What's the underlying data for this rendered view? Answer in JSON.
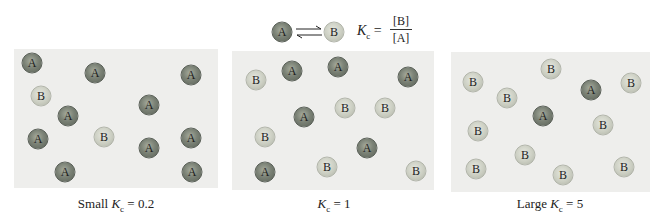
{
  "header": {
    "reactant_label": "A",
    "product_label": "B",
    "equilibrium_symbol": "⇌",
    "kc_symbol": "K",
    "kc_subscript": "c",
    "equals": "=",
    "numerator": "[B]",
    "denominator": "[A]"
  },
  "colors": {
    "panel_bg": "#eeeeec",
    "sphere_A": "#6e7569",
    "sphere_B": "#cbcec2"
  },
  "panels": [
    {
      "caption_prefix": "Small ",
      "caption_k": "K",
      "caption_sub": "c",
      "caption_suffix": " = 0.2",
      "count_A": 10,
      "count_B": 2,
      "molecules": [
        {
          "type": "A",
          "x": 32,
          "y": 63
        },
        {
          "type": "A",
          "x": 95,
          "y": 73
        },
        {
          "type": "A",
          "x": 191,
          "y": 75
        },
        {
          "type": "B",
          "x": 41,
          "y": 96
        },
        {
          "type": "A",
          "x": 68,
          "y": 116
        },
        {
          "type": "A",
          "x": 149,
          "y": 105
        },
        {
          "type": "A",
          "x": 38,
          "y": 139
        },
        {
          "type": "B",
          "x": 104,
          "y": 137
        },
        {
          "type": "A",
          "x": 149,
          "y": 148
        },
        {
          "type": "A",
          "x": 191,
          "y": 138
        },
        {
          "type": "A",
          "x": 65,
          "y": 172
        },
        {
          "type": "A",
          "x": 192,
          "y": 172
        }
      ]
    },
    {
      "caption_prefix": "",
      "caption_k": "K",
      "caption_sub": "c",
      "caption_suffix": " = 1",
      "count_A": 6,
      "count_B": 6,
      "molecules": [
        {
          "type": "B",
          "x": 256,
          "y": 80
        },
        {
          "type": "A",
          "x": 292,
          "y": 71
        },
        {
          "type": "A",
          "x": 338,
          "y": 67
        },
        {
          "type": "A",
          "x": 408,
          "y": 77
        },
        {
          "type": "B",
          "x": 345,
          "y": 108
        },
        {
          "type": "B",
          "x": 385,
          "y": 108
        },
        {
          "type": "A",
          "x": 304,
          "y": 117
        },
        {
          "type": "B",
          "x": 265,
          "y": 137
        },
        {
          "type": "A",
          "x": 367,
          "y": 148
        },
        {
          "type": "A",
          "x": 265,
          "y": 172
        },
        {
          "type": "B",
          "x": 327,
          "y": 167
        },
        {
          "type": "B",
          "x": 416,
          "y": 171
        }
      ]
    },
    {
      "caption_prefix": "Large ",
      "caption_k": "K",
      "caption_sub": "c",
      "caption_suffix": " = 5",
      "count_A": 2,
      "count_B": 10,
      "molecules": [
        {
          "type": "B",
          "x": 551,
          "y": 69
        },
        {
          "type": "B",
          "x": 473,
          "y": 82
        },
        {
          "type": "A",
          "x": 591,
          "y": 90
        },
        {
          "type": "B",
          "x": 631,
          "y": 83
        },
        {
          "type": "B",
          "x": 507,
          "y": 98
        },
        {
          "type": "A",
          "x": 543,
          "y": 116
        },
        {
          "type": "B",
          "x": 603,
          "y": 125
        },
        {
          "type": "B",
          "x": 478,
          "y": 131
        },
        {
          "type": "B",
          "x": 525,
          "y": 155
        },
        {
          "type": "B",
          "x": 476,
          "y": 169
        },
        {
          "type": "B",
          "x": 563,
          "y": 175
        },
        {
          "type": "B",
          "x": 624,
          "y": 167
        }
      ]
    }
  ]
}
